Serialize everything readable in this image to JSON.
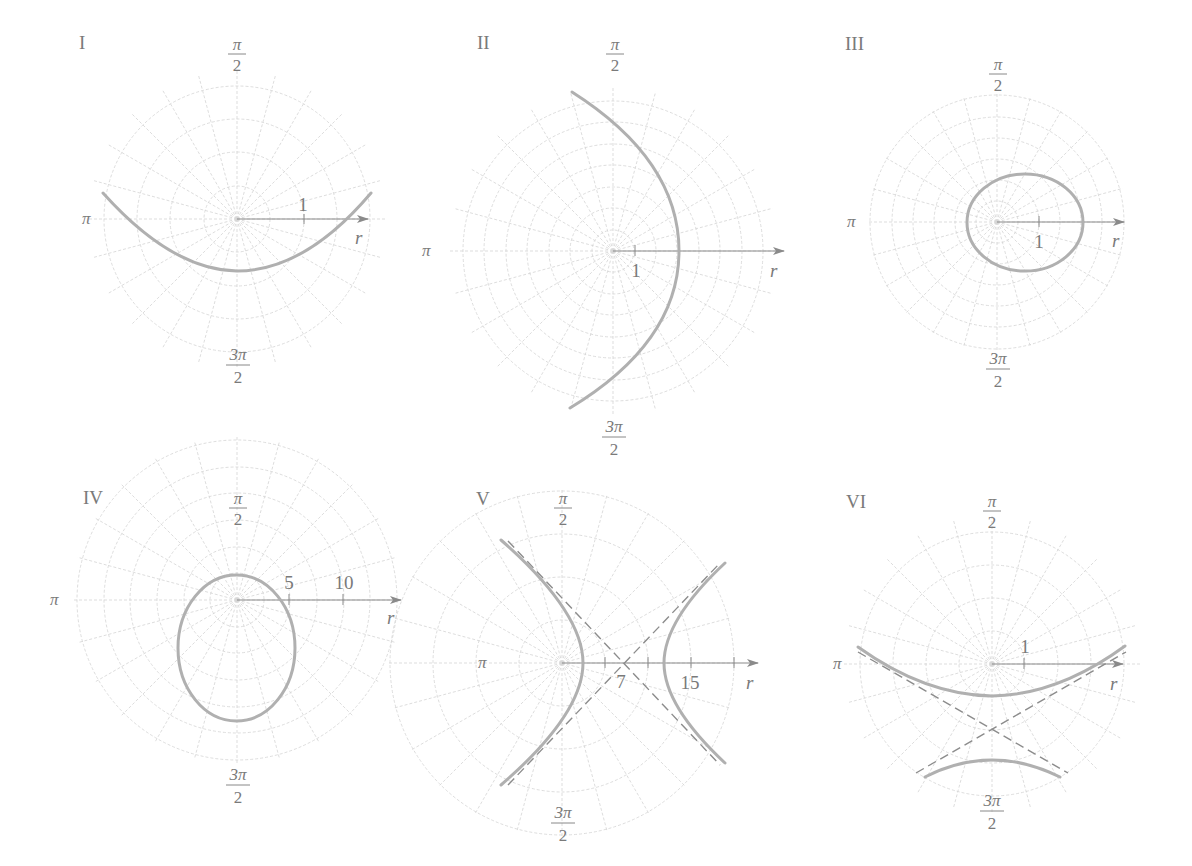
{
  "figure": {
    "panels": [
      {
        "id": "I",
        "label": "I",
        "angle_labels": {
          "top": {
            "num": "π",
            "den": "2"
          },
          "left": "π",
          "bottom": {
            "num": "3π",
            "den": "2"
          }
        },
        "axis_label": "r",
        "tick_labels": [
          "1"
        ],
        "curve": "parabola opening upward"
      },
      {
        "id": "II",
        "label": "II",
        "angle_labels": {
          "top": {
            "num": "π",
            "den": "2"
          },
          "left": "π",
          "bottom": {
            "num": "3π",
            "den": "2"
          }
        },
        "axis_label": "r",
        "tick_labels": [
          "1"
        ],
        "curve": "parabola opening leftward"
      },
      {
        "id": "III",
        "label": "III",
        "angle_labels": {
          "top": {
            "num": "π",
            "den": "2"
          },
          "left": "π",
          "bottom": {
            "num": "3π",
            "den": "2"
          }
        },
        "axis_label": "r",
        "tick_labels": [
          "1"
        ],
        "curve": "ellipse, horizontal major axis"
      },
      {
        "id": "IV",
        "label": "IV",
        "angle_labels": {
          "top": {
            "num": "π",
            "den": "2"
          },
          "left": "π",
          "bottom": {
            "num": "3π",
            "den": "2"
          }
        },
        "axis_label": "r",
        "tick_labels": [
          "5",
          "10"
        ],
        "curve": "ellipse, vertical major axis"
      },
      {
        "id": "V",
        "label": "V",
        "angle_labels": {
          "top": {
            "num": "π",
            "den": "2"
          },
          "left": "π",
          "bottom": {
            "num": "3π",
            "den": "2"
          }
        },
        "axis_label": "r",
        "tick_labels": [
          "7",
          "15"
        ],
        "curve": "hyperbola, horizontal transverse axis with dashed asymptotes"
      },
      {
        "id": "VI",
        "label": "VI",
        "angle_labels": {
          "top": {
            "num": "π",
            "den": "2"
          },
          "left": "π",
          "bottom": {
            "num": "3π",
            "den": "2"
          }
        },
        "axis_label": "r",
        "tick_labels": [
          "1"
        ],
        "curve": "hyperbola, vertical transverse axis with dashed asymptotes"
      }
    ],
    "colors": {
      "grid": "#d4d4d4",
      "axis": "#8a8a8a",
      "curve": "#b0b0b0",
      "asymptote": "#8c8c8c",
      "label": "#7a7a7a"
    }
  }
}
